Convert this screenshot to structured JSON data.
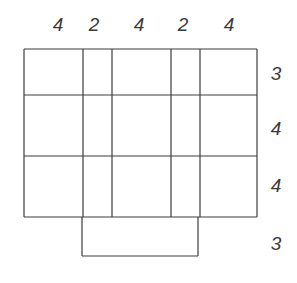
{
  "diagram": {
    "type": "grid-net",
    "line_color": "#3c3c3c",
    "label_color": "#3a3a3a",
    "column_labels": [
      {
        "text": "4",
        "x": 58,
        "y": 24
      },
      {
        "text": "2",
        "x": 94,
        "y": 24
      },
      {
        "text": "4",
        "x": 139,
        "y": 24
      },
      {
        "text": "2",
        "x": 183,
        "y": 24
      },
      {
        "text": "4",
        "x": 229,
        "y": 24
      }
    ],
    "row_labels": [
      {
        "text": "3",
        "x": 276,
        "y": 73
      },
      {
        "text": "4",
        "x": 276,
        "y": 128
      },
      {
        "text": "4",
        "x": 276,
        "y": 185
      },
      {
        "text": "3",
        "x": 276,
        "y": 243
      }
    ],
    "main_grid": {
      "x_lines": [
        24,
        83,
        112,
        171,
        200,
        257
      ],
      "y_lines": [
        49,
        95,
        156,
        217
      ]
    },
    "extension": {
      "x1": 82,
      "x2": 198,
      "y1": 217,
      "y2": 256
    }
  }
}
